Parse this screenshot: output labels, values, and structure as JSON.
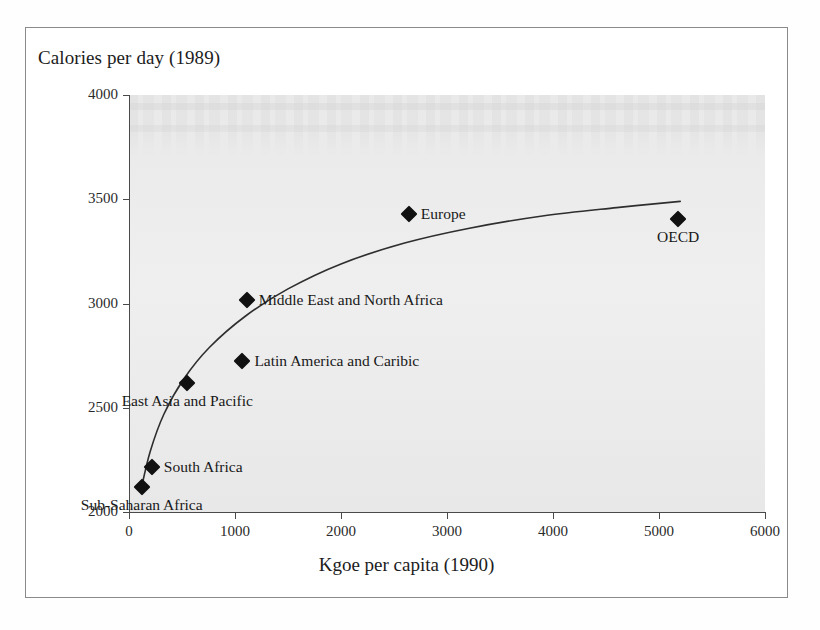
{
  "chart_data": {
    "type": "scatter",
    "title": "",
    "xlabel": "Kgoe per capita (1990)",
    "ylabel": "Calories per day (1989)",
    "xlim": [
      0,
      6000
    ],
    "ylim": [
      2000,
      4000
    ],
    "xticks": [
      0,
      1000,
      2000,
      3000,
      4000,
      5000,
      6000
    ],
    "yticks": [
      2000,
      2500,
      3000,
      3500,
      4000
    ],
    "grid": false,
    "legend": "none",
    "marker_shape": "diamond",
    "marker_color": "#111111",
    "points": [
      {
        "label": "Sub-Saharan Africa",
        "x": 120,
        "y": 2120,
        "label_pos": "below"
      },
      {
        "label": "South Africa",
        "x": 215,
        "y": 2215,
        "label_pos": "right"
      },
      {
        "label": "East Asia and Pacific",
        "x": 550,
        "y": 2620,
        "label_pos": "below"
      },
      {
        "label": "Latin America and Caribic",
        "x": 1070,
        "y": 2725,
        "label_pos": "right"
      },
      {
        "label": "Middle East and North Africa",
        "x": 1110,
        "y": 3015,
        "label_pos": "right"
      },
      {
        "label": "Europe",
        "x": 2640,
        "y": 3430,
        "label_pos": "right"
      },
      {
        "label": "OECD",
        "x": 5180,
        "y": 3405,
        "label_pos": "below"
      }
    ],
    "trend_curve": {
      "description": "fitted logarithmic trend line through the data points",
      "x": [
        110,
        200,
        330,
        520,
        760,
        1100,
        1500,
        2000,
        2600,
        3200,
        3900,
        4600,
        5200
      ],
      "y": [
        2100,
        2290,
        2470,
        2640,
        2790,
        2940,
        3070,
        3190,
        3290,
        3360,
        3420,
        3460,
        3490
      ]
    }
  },
  "axis_titles": {
    "y": "Calories per day (1989)",
    "x": "Kgoe per capita (1990)"
  }
}
